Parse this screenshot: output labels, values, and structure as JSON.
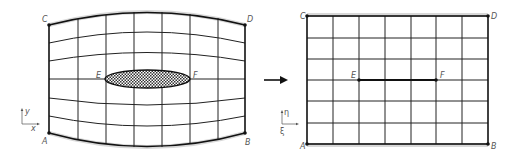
{
  "figure": {
    "physical_domain": {
      "corner_labels": {
        "A": "A",
        "B": "B",
        "C": "C",
        "D": "D"
      },
      "obstacle_labels": {
        "E": "E",
        "F": "F"
      },
      "axis_labels": {
        "x": "x",
        "y": "y"
      }
    },
    "computational_domain": {
      "corner_labels": {
        "A": "A",
        "B": "B",
        "C": "C",
        "D": "D"
      },
      "cut_labels": {
        "E": "E",
        "F": "F"
      },
      "axis_labels": {
        "xi": "ξ",
        "eta": "η"
      }
    },
    "arrow": "right-arrow"
  },
  "colors": {
    "line": "#222222",
    "label": "#555555",
    "halo": "#d8d8d8"
  }
}
